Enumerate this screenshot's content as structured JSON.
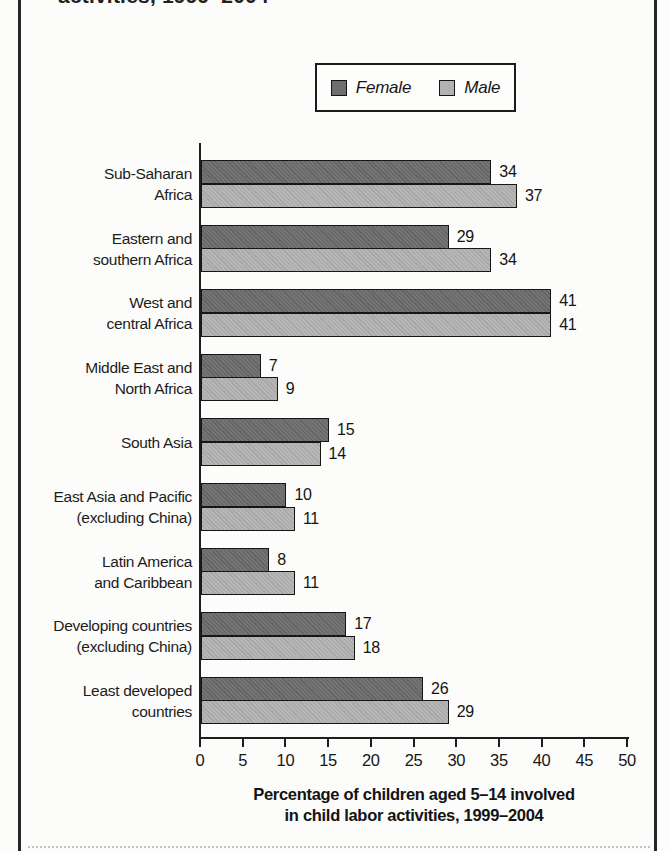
{
  "page": {
    "top_title_fragment": "activities, 1999–2004",
    "background": "#fcfcfa",
    "frame_color": "#262626"
  },
  "legend": {
    "items": [
      {
        "label": "Female",
        "color": "#6e6e6e"
      },
      {
        "label": "Male",
        "color": "#b2b2b2"
      }
    ]
  },
  "chart_data": {
    "type": "bar",
    "orientation": "horizontal",
    "title_fragment": "activities, 1999–2004",
    "categories": [
      [
        "Sub-Saharan",
        "Africa"
      ],
      [
        "Eastern and",
        "southern Africa"
      ],
      [
        "West and",
        "central Africa"
      ],
      [
        "Middle East and",
        "North Africa"
      ],
      [
        "South Asia"
      ],
      [
        "East Asia and Pacific",
        "(excluding China)"
      ],
      [
        "Latin America",
        "and Caribbean"
      ],
      [
        "Developing countries",
        "(excluding China)"
      ],
      [
        "Least developed",
        "countries"
      ]
    ],
    "series": [
      {
        "name": "Female",
        "color": "#6e6e6e",
        "values": [
          34,
          29,
          41,
          7,
          15,
          10,
          8,
          17,
          26
        ]
      },
      {
        "name": "Male",
        "color": "#b2b2b2",
        "values": [
          37,
          34,
          41,
          9,
          14,
          11,
          11,
          18,
          29
        ]
      }
    ],
    "value_labels": true,
    "xlim": [
      0,
      50
    ],
    "xticks": [
      0,
      5,
      10,
      15,
      20,
      25,
      30,
      35,
      40,
      45,
      50
    ],
    "xlabel_lines": [
      "Percentage of children aged 5–14 involved",
      "in child labor activities, 1999–2004"
    ],
    "legend_position": "top-right",
    "grid": false
  }
}
